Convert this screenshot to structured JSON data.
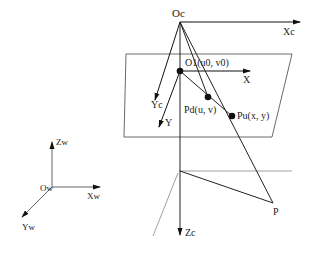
{
  "camera_frame": {
    "origin": "Oc",
    "x_axis": "Xc",
    "y_axis": "Yc",
    "z_axis": "Zc"
  },
  "image_plane": {
    "principal_point": "O1(u0, v0)",
    "x_axis": "X",
    "y_axis": "Y",
    "pixel_point": "Pd(u, v)",
    "image_point": "Pu(x, y)"
  },
  "world_frame": {
    "origin": "Ow",
    "x_axis": "Xw",
    "y_axis": "Yw",
    "z_axis": "Zw"
  },
  "object_point": "P"
}
